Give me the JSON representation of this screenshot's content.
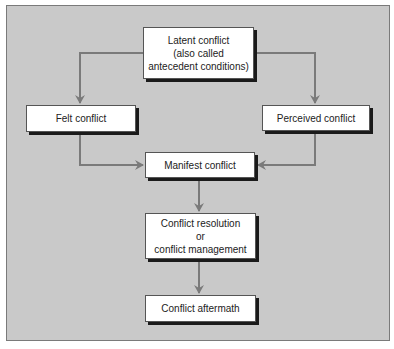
{
  "diagram": {
    "type": "flowchart",
    "colors": {
      "panel_bg": "#c9c9c9",
      "node_bg": "#ffffff",
      "arrow": "#7a7a7a"
    },
    "nodes": {
      "latent": {
        "lines": [
          "Latent conflict",
          "(also called",
          "antecedent conditions)"
        ]
      },
      "felt": {
        "lines": [
          "Felt conflict"
        ]
      },
      "perceived": {
        "lines": [
          "Perceived conflict"
        ]
      },
      "manifest": {
        "lines": [
          "Manifest conflict"
        ]
      },
      "resolution": {
        "lines": [
          "Conflict resolution",
          "or",
          "conflict management"
        ]
      },
      "aftermath": {
        "lines": [
          "Conflict aftermath"
        ]
      }
    },
    "edges": [
      {
        "from": "latent",
        "to": "felt"
      },
      {
        "from": "latent",
        "to": "perceived"
      },
      {
        "from": "felt",
        "to": "manifest"
      },
      {
        "from": "perceived",
        "to": "manifest"
      },
      {
        "from": "manifest",
        "to": "resolution"
      },
      {
        "from": "resolution",
        "to": "aftermath"
      }
    ]
  }
}
